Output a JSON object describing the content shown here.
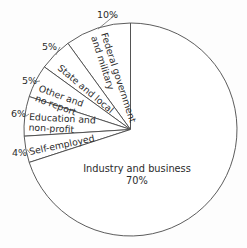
{
  "chart_data": {
    "type": "pie",
    "title": "",
    "subtitle": "",
    "xlabel": "",
    "ylabel": "",
    "legend_position": "none",
    "grid": false,
    "total": 100,
    "units": "percent",
    "start_angle_deg": 90,
    "direction": "counterclockwise",
    "categories": [
      "Federal government and military",
      "State and local",
      "Other and no report",
      "Education and non-profit",
      "Self-employed",
      "Industry and business"
    ],
    "values": [
      10,
      5,
      5,
      6,
      4,
      70
    ],
    "slices": [
      {
        "label_line1": "Federal government",
        "label_line2": "and military",
        "label_full": "Federal government and military",
        "value": 10,
        "pct_label": "10%",
        "label_rotation_deg": 72,
        "pct_x": 97,
        "pct_y": 18
      },
      {
        "label_line1": "State and local",
        "label_line2": "",
        "label_full": "State and local",
        "value": 5,
        "pct_label": "5%",
        "label_rotation_deg": 40,
        "pct_x": 42,
        "pct_y": 50
      },
      {
        "label_line1": "Other and",
        "label_line2": "no report",
        "label_full": "Other and no report",
        "value": 5,
        "pct_label": "5%",
        "label_rotation_deg": 20,
        "pct_x": 22,
        "pct_y": 84
      },
      {
        "label_line1": "Education and",
        "label_line2": "non-profit",
        "label_full": "Education and non-profit",
        "value": 6,
        "pct_label": "6%",
        "label_rotation_deg": 3,
        "pct_x": 11,
        "pct_y": 117
      },
      {
        "label_line1": "Self-employed",
        "label_line2": "",
        "label_full": "Self-employed",
        "value": 4,
        "pct_label": "4%",
        "label_rotation_deg": -12,
        "pct_x": 12,
        "pct_y": 156
      },
      {
        "label_line1": "Industry and business",
        "label_line2": "70%",
        "label_full": "Industry and business",
        "value": 70,
        "pct_label": "70%",
        "label_rotation_deg": 0,
        "pct_x": 0,
        "pct_y": 0
      }
    ],
    "colors": {
      "slice_fill": "#ffffff",
      "slice_stroke": "#4a4a4a",
      "leader_line": "#6a6a6a",
      "text": "#2b2b2b",
      "background": "#fdfdfd"
    }
  }
}
